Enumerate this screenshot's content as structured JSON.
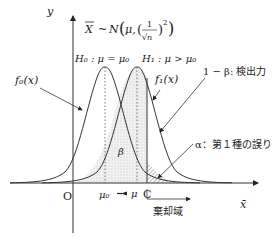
{
  "diagram": {
    "axes": {
      "y_label": "y",
      "x_label": "x̄",
      "origin_label": "O"
    },
    "distribution_label": {
      "lhs": "X",
      "tilde": "~",
      "N": "N",
      "mu": "μ,",
      "numerator": "1",
      "denominator": "√n",
      "exponent": "2"
    },
    "hypotheses": {
      "h0": "H₀ : μ = μ₀",
      "h1": "H₁ : μ > μ₀"
    },
    "curves": {
      "f0_label": "f₀(x)",
      "f1_label": "f₁(x)"
    },
    "annotations": {
      "power": "1 − β: 検出力",
      "alpha": "α：第１種の誤り",
      "beta": "β",
      "rejection_region": "棄却域"
    },
    "x_ticks": {
      "mu0": "μ₀",
      "mu": "μ",
      "c": "C"
    },
    "colors": {
      "line": "#333333",
      "shade": "#888888"
    }
  }
}
